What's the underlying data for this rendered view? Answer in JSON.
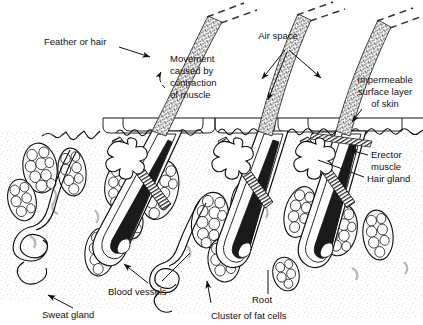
{
  "figure": {
    "background_color": "#ffffff",
    "ink_color": "#111111",
    "stipple_color": "#9a9a9a",
    "vessel_color": "#b9b9b9",
    "width": 423,
    "height": 325
  },
  "labels": {
    "feather_or_hair": "Feather or hair",
    "movement_line1": "Movement",
    "movement_line2": "caused by",
    "movement_line3": "contraction",
    "movement_line4": "of muscle",
    "air_space": "Air space",
    "impermeable_line1": "Impermeable",
    "impermeable_line2": "surface layer",
    "impermeable_line3": "of skin",
    "erector_line1": "Erector",
    "erector_line2": "muscle",
    "hair_gland": "Hair gland",
    "blood_vessels": "Blood vessels",
    "sweat_gland": "Sweat gland",
    "cluster_of_fat_cells": "Cluster of fat cells",
    "root": "Root"
  },
  "structures": {
    "hair_shafts": [
      {
        "name": "hair-shaft-left",
        "root_x": 95,
        "root_y": 255,
        "tip_x": 205,
        "tip_y": 8,
        "dashed_tip": true
      },
      {
        "name": "hair-shaft-middle",
        "root_x": 218,
        "root_y": 262,
        "tip_x": 300,
        "tip_y": 8,
        "dashed_tip": true
      },
      {
        "name": "hair-shaft-right",
        "root_x": 300,
        "root_y": 262,
        "tip_x": 380,
        "tip_y": 14,
        "dashed_tip": true
      }
    ],
    "surface_layer_y": 118,
    "epidermis_wave_y": 130,
    "air_space_pockets": 5,
    "fat_cell_clusters": 14,
    "sweat_glands": 2,
    "erector_muscles": 3,
    "hair_glands": 3
  }
}
